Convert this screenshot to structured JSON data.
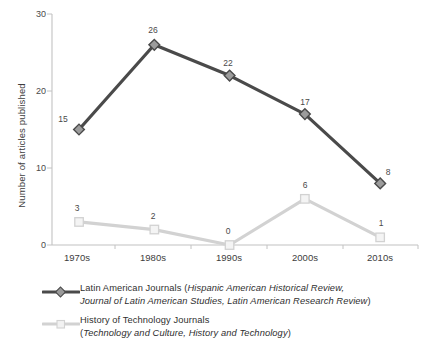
{
  "chart_data": {
    "type": "line",
    "title": "",
    "xlabel": "",
    "ylabel": "Number of articles published",
    "categories": [
      "1970s",
      "1980s",
      "1990s",
      "2000s",
      "2010s"
    ],
    "ylim": [
      0,
      30
    ],
    "yticks": [
      0,
      10,
      20,
      30
    ],
    "grid": false,
    "legend_position": "bottom-left",
    "series": [
      {
        "name": "Latin American Journals",
        "sources": "Hispanic American Historical Review, Journal of Latin American Studies, Latin American Research Review",
        "color": "#4a4a4a",
        "marker": "diamond",
        "values": [
          15,
          26,
          22,
          17,
          8
        ]
      },
      {
        "name": "History of Technology Journals",
        "sources": "Technology and Culture, History and Technology",
        "color": "#d2d2d2",
        "marker": "square",
        "values": [
          3,
          2,
          0,
          6,
          1
        ]
      }
    ]
  },
  "axis": {
    "ytick_labels": [
      "0",
      "10",
      "20",
      "30"
    ],
    "xtick_labels": [
      "1970s",
      "1980s",
      "1990s",
      "2000s",
      "2010s"
    ],
    "y_title": "Number of articles published",
    "axis_color": "#bdbdbd"
  },
  "data_labels": {
    "series1": [
      "15",
      "26",
      "22",
      "17",
      "8"
    ],
    "series2": [
      "3",
      "2",
      "0",
      "6",
      "1"
    ]
  },
  "legend": {
    "items": [
      {
        "label_plain_1": "Latin American Journals (",
        "label_italic_1": "Hispanic American Historical Review,",
        "label_italic_2": "Journal of Latin American Studies, Latin American Research Review",
        "label_plain_2": ")",
        "color": "#4a4a4a"
      },
      {
        "label_plain_1": "History of Technology Journals",
        "label_paren_open": "(",
        "label_italic_1": "Technology and Culture, History and Technology",
        "label_paren_close": ")",
        "color": "#d2d2d2"
      }
    ]
  },
  "colors": {
    "dark_series": "#4a4a4a",
    "light_series": "#d2d2d2",
    "axis": "#bdbdbd",
    "text": "#3d3d3d",
    "background": "#ffffff"
  }
}
